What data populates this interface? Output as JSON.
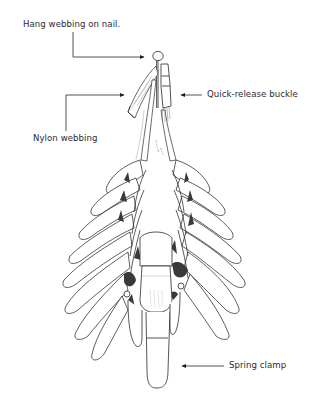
{
  "figure": {
    "labels": {
      "nail": "Hang webbing on nail.",
      "buckle": "Quick-release buckle",
      "nylon": "Nylon webbing",
      "clamp": "Spring clamp"
    },
    "callouts": [
      {
        "id": "nail",
        "target": "nail-head",
        "arrow": "right"
      },
      {
        "id": "buckle",
        "target": "buckle",
        "arrow": "left"
      },
      {
        "id": "nylon",
        "target": "webbing-loose-end",
        "arrow": "right"
      },
      {
        "id": "clamp",
        "target": "bottom-clamp",
        "arrow": "left"
      }
    ],
    "colors": {
      "ink": "#2a2a2a",
      "background": "#ffffff",
      "shade": "#3a3a3a"
    }
  }
}
